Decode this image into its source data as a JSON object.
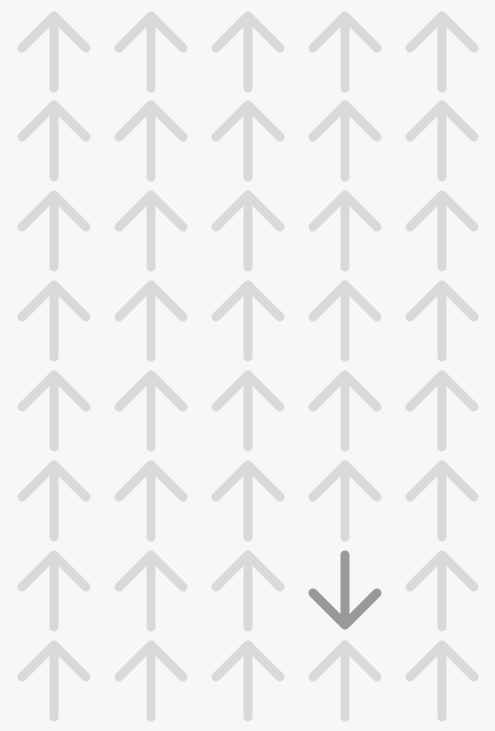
{
  "puzzle": {
    "type": "odd-one-out",
    "rows": 8,
    "cols": 5,
    "default_direction": "up",
    "odd_cell": {
      "row": 6,
      "col": 3,
      "direction": "down"
    },
    "colors": {
      "background": "#f7f7f7",
      "arrow": "#d9d9d9",
      "odd_arrow": "#999999"
    },
    "col_centers": [
      54,
      151,
      248,
      345,
      442
    ],
    "row_tops": [
      8,
      97,
      187,
      277,
      367,
      457,
      547,
      637
    ]
  }
}
